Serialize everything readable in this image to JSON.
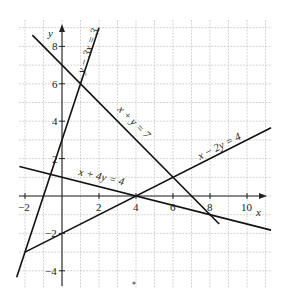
{
  "chart_data": {
    "type": "line",
    "title": "",
    "xlabel": "x",
    "ylabel": "y",
    "xlim": [
      -2,
      11
    ],
    "ylim": [
      -4.5,
      9
    ],
    "grid": true,
    "x_ticks": [
      {
        "value": -2,
        "label": "−2"
      },
      {
        "value": 2,
        "label": "2"
      },
      {
        "value": 4,
        "label": "4"
      },
      {
        "value": 6,
        "label": "6"
      },
      {
        "value": 8,
        "label": "8"
      },
      {
        "value": 10,
        "label": "10"
      }
    ],
    "y_ticks": [
      {
        "value": 8,
        "label": "8"
      },
      {
        "value": 6,
        "label": "6"
      },
      {
        "value": 4,
        "label": "4"
      },
      {
        "value": 2,
        "label": "2"
      },
      {
        "value": -2,
        "label": "−2"
      },
      {
        "value": -4,
        "label": "−4"
      }
    ],
    "series": [
      {
        "name": "y − 3x = 3",
        "equation": "y - 3x = 3",
        "x": [
          -2.45,
          2.0
        ],
        "y": [
          -4.35,
          9.0
        ]
      },
      {
        "name": "x + y = 7",
        "equation": "x + y = 7",
        "x": [
          -1.6,
          8.5
        ],
        "y": [
          8.6,
          -1.5
        ]
      },
      {
        "name": "x − 2y = 4",
        "equation": "x - 2y = 4",
        "x": [
          -2.0,
          11.3
        ],
        "y": [
          -3.0,
          3.65
        ]
      },
      {
        "name": "x + 4y = 4",
        "equation": "x + 4y = 4",
        "x": [
          -2.3,
          11.3
        ],
        "y": [
          1.575,
          -1.825
        ]
      }
    ],
    "intersections": [
      {
        "x": 1,
        "y": 6
      },
      {
        "x": -2,
        "y": -3
      },
      {
        "x": 4,
        "y": 0
      },
      {
        "x": 6,
        "y": 1
      },
      {
        "x": 8,
        "y": -1
      },
      {
        "x": -0.31,
        "y": 1.08
      }
    ]
  },
  "labels": {
    "x_axis": "x",
    "y_axis": "y",
    "eq1": "y − 3x = 3",
    "eq2": "x + y = 7",
    "eq3": "x − 2y = 4",
    "eq4": "x + 4y = 4"
  }
}
